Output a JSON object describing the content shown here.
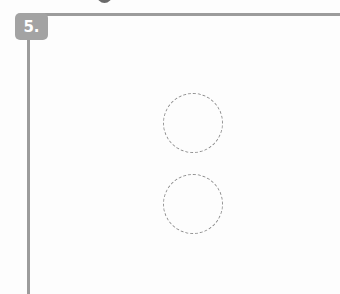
{
  "exercise": {
    "number_label": "5."
  },
  "answer_circles": [
    {
      "id": "circle-1"
    },
    {
      "id": "circle-2"
    }
  ],
  "colors": {
    "rule": "#9c9c9c",
    "badge": "#a3a3a3",
    "badge_text": "#ffffff",
    "circle_stroke": "#8f8f8f"
  }
}
